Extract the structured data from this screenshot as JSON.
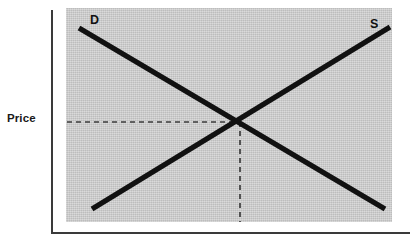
{
  "figure": {
    "background_color": "#ffffff",
    "plot_fill_color": "#cdcdcd",
    "axis_color": "#3a3a3a",
    "curve_color": "#111111",
    "dashed_color": "#3c3c3c"
  },
  "axes": {
    "y_axis_label": "Price",
    "x_axis_label": "",
    "y_axis_name": "y-axis-line",
    "x_axis_name": "x-axis-line"
  },
  "curves": {
    "demand": {
      "label": "D",
      "name": "demand-curve",
      "start": [
        79,
        28
      ],
      "end": [
        385,
        209
      ],
      "slope": "downward"
    },
    "supply": {
      "label": "S",
      "name": "supply-curve",
      "start": [
        92,
        209
      ],
      "end": [
        390,
        27
      ],
      "slope": "upward"
    }
  },
  "equilibrium": {
    "point": [
      240,
      122
    ],
    "price_guide": {
      "from": [
        67,
        122
      ],
      "to": [
        240,
        122
      ]
    },
    "quantity_guide": {
      "from": [
        240,
        122
      ],
      "to": [
        240,
        222
      ]
    }
  },
  "chart_data": {
    "type": "line",
    "title": "",
    "subtitle": "",
    "xlabel": "",
    "ylabel": "Price",
    "grid": false,
    "legend": "inline-curve-labels",
    "annotations": [
      "D",
      "S"
    ],
    "xlim": [
      0,
      100
    ],
    "ylim": [
      0,
      100
    ],
    "x": [
      0,
      100
    ],
    "series": [
      {
        "name": "D",
        "label": "Demand",
        "x": [
          4,
          98
        ],
        "values": [
          91,
          6
        ]
      },
      {
        "name": "S",
        "label": "Supply",
        "x": [
          8,
          100
        ],
        "values": [
          6,
          92
        ]
      }
    ],
    "equilibrium": {
      "x": 53,
      "y": 47
    },
    "xticks": [],
    "yticks": [],
    "xticklabels": [],
    "yticklabels": []
  }
}
